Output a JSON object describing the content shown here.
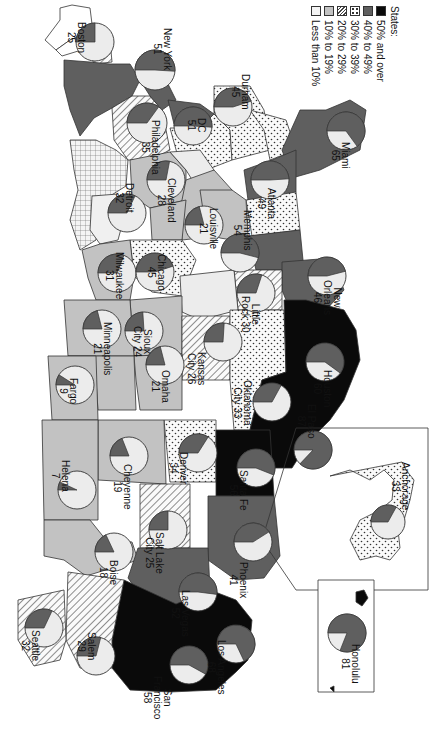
{
  "legend": {
    "title": "States:",
    "items": [
      {
        "label": "50% and over",
        "pattern": "black",
        "color": "#0a0a0a"
      },
      {
        "label": "40% to 49%",
        "pattern": "dark-gray",
        "color": "#5f5f5f"
      },
      {
        "label": "30% to 39%",
        "pattern": "dots",
        "color": "#ffffff"
      },
      {
        "label": "20% to 29%",
        "pattern": "hatch",
        "color": "#ffffff"
      },
      {
        "label": "10% to 19%",
        "pattern": "light-gray",
        "color": "#c2c2c2"
      },
      {
        "label": "Less than 10%",
        "pattern": "white",
        "color": "#ececec"
      }
    ]
  },
  "inset_labels": {
    "alaska": "Alaska inset",
    "hawaii": "Hawaii inset"
  },
  "chart_data": {
    "type": "pie",
    "title": "",
    "legend_title": "States:",
    "legend": [
      "50% and over",
      "40% to 49%",
      "30% to 39%",
      "20% to 29%",
      "10% to 19%",
      "Less than 10%"
    ],
    "cities": [
      {
        "name": "Boston",
        "value": 25
      },
      {
        "name": "New York",
        "value": 51
      },
      {
        "name": "Philadelphia",
        "value": 35
      },
      {
        "name": "D.C.",
        "value": 51
      },
      {
        "name": "Durham",
        "value": 45
      },
      {
        "name": "Miami",
        "value": 65
      },
      {
        "name": "Atlanta",
        "value": 49
      },
      {
        "name": "Detroit",
        "value": 32
      },
      {
        "name": "Cleveland",
        "value": 28
      },
      {
        "name": "Louisville",
        "value": 21
      },
      {
        "name": "Memphis",
        "value": 54
      },
      {
        "name": "Milwaukee",
        "value": 31
      },
      {
        "name": "Chicago",
        "value": 45
      },
      {
        "name": "Little Rock",
        "value": 30
      },
      {
        "name": "New Orleans",
        "value": 46
      },
      {
        "name": "Minneapolis",
        "value": 21
      },
      {
        "name": "Sioux City",
        "value": 24
      },
      {
        "name": "Kansas City",
        "value": 26
      },
      {
        "name": "Oklahoma City",
        "value": 33
      },
      {
        "name": "Houston",
        "value": 60
      },
      {
        "name": "Fargo",
        "value": 9
      },
      {
        "name": "Omaha",
        "value": 21
      },
      {
        "name": "El Paso",
        "value": 87
      },
      {
        "name": "Helena",
        "value": 7
      },
      {
        "name": "Cheyenne",
        "value": 19
      },
      {
        "name": "Denver",
        "value": 34
      },
      {
        "name": "Santa Fe",
        "value": 56
      },
      {
        "name": "Salt Lake City",
        "value": 25
      },
      {
        "name": "Phoenix",
        "value": 41
      },
      {
        "name": "Boise",
        "value": 18
      },
      {
        "name": "Las Vegas",
        "value": 52
      },
      {
        "name": "Seattle",
        "value": 32
      },
      {
        "name": "Salem",
        "value": 29
      },
      {
        "name": "Los Angeles",
        "value": 68
      },
      {
        "name": "San Francisco",
        "value": 58
      },
      {
        "name": "Anchorage",
        "value": 33
      },
      {
        "name": "Honolulu",
        "value": 81
      }
    ]
  },
  "pies": [
    {
      "name": "Boston",
      "value": 25,
      "cx": 95,
      "cy": 42,
      "r": 19,
      "label_lines": [
        "Boston",
        "25"
      ],
      "lx": 76,
      "ly": 22
    },
    {
      "name": "New York",
      "value": 51,
      "cx": 155,
      "cy": 70,
      "r": 20,
      "label_lines": [
        "New York",
        "51"
      ],
      "lx": 162,
      "ly": 28
    },
    {
      "name": "Philadelphia",
      "value": 35,
      "cx": 147,
      "cy": 123,
      "r": 20,
      "label_lines": [
        "Philadelphia",
        "35"
      ],
      "lx": 150,
      "ly": 120
    },
    {
      "name": "D.C.",
      "value": 51,
      "cx": 193,
      "cy": 126,
      "r": 19,
      "label_lines": [
        "DC",
        "51"
      ],
      "lx": 196,
      "ly": 118
    },
    {
      "name": "Durham",
      "value": 45,
      "cx": 233,
      "cy": 107,
      "r": 19,
      "label_lines": [
        "Durham",
        "45"
      ],
      "lx": 240,
      "ly": 74
    },
    {
      "name": "Miami",
      "value": 65,
      "cx": 346,
      "cy": 131,
      "r": 19,
      "label_lines": [
        "Miami",
        "65"
      ],
      "lx": 340,
      "ly": 142
    },
    {
      "name": "Atlanta",
      "value": 49,
      "cx": 270,
      "cy": 180,
      "r": 19,
      "label_lines": [
        "Atlanta",
        "49"
      ],
      "lx": 266,
      "ly": 188
    },
    {
      "name": "Detroit",
      "value": 32,
      "cx": 127,
      "cy": 213,
      "r": 19,
      "label_lines": [
        "Detroit",
        "32"
      ],
      "lx": 124,
      "ly": 183
    },
    {
      "name": "Cleveland",
      "value": 28,
      "cx": 166,
      "cy": 180,
      "r": 19,
      "label_lines": [
        "Cleveland",
        "28"
      ],
      "lx": 166,
      "ly": 178
    },
    {
      "name": "Louisville",
      "value": 21,
      "cx": 204,
      "cy": 225,
      "r": 19,
      "label_lines": [
        "Louisville",
        "21"
      ],
      "lx": 208,
      "ly": 208
    },
    {
      "name": "Memphis",
      "value": 54,
      "cx": 240,
      "cy": 253,
      "r": 19,
      "label_lines": [
        "Memphis",
        "54"
      ],
      "lx": 242,
      "ly": 210
    },
    {
      "name": "Milwaukee",
      "value": 31,
      "cx": 117,
      "cy": 273,
      "r": 19,
      "label_lines": [
        "Milwaukee",
        "31"
      ],
      "lx": 114,
      "ly": 252
    },
    {
      "name": "Chicago",
      "value": 45,
      "cx": 155,
      "cy": 272,
      "r": 19,
      "label_lines": [
        "Chicago",
        "45"
      ],
      "lx": 156,
      "ly": 254
    },
    {
      "name": "Little Rock",
      "value": 30,
      "cx": 256,
      "cy": 293,
      "r": 19,
      "label_lines": [
        "Little",
        "Rock 30"
      ],
      "lx": 250,
      "ly": 296
    },
    {
      "name": "New Orleans",
      "value": 46,
      "cx": 327,
      "cy": 276,
      "r": 19,
      "label_lines": [
        "New",
        "Orleans",
        "46"
      ],
      "lx": 332,
      "ly": 280
    },
    {
      "name": "Minneapolis",
      "value": 21,
      "cx": 102,
      "cy": 329,
      "r": 19,
      "label_lines": [
        "Minneapolis",
        "21"
      ],
      "lx": 102,
      "ly": 322
    },
    {
      "name": "Sioux City",
      "value": 24,
      "cx": 144,
      "cy": 331,
      "r": 19,
      "label_lines": [
        "Sioux",
        "City 24"
      ],
      "lx": 142,
      "ly": 326
    },
    {
      "name": "Kansas City",
      "value": 26,
      "cx": 223,
      "cy": 342,
      "r": 19,
      "label_lines": [
        "Kansas",
        "City 26"
      ],
      "lx": 196,
      "ly": 352
    },
    {
      "name": "Oklahoma City",
      "value": 33,
      "cx": 272,
      "cy": 402,
      "r": 19,
      "label_lines": [
        "Oklahoma",
        "City 33"
      ],
      "lx": 242,
      "ly": 380
    },
    {
      "name": "Houston",
      "value": 60,
      "cx": 325,
      "cy": 362,
      "r": 19,
      "label_lines": [
        "Houston",
        "60"
      ],
      "lx": 322,
      "ly": 370
    },
    {
      "name": "Fargo",
      "value": 9,
      "cx": 75,
      "cy": 385,
      "r": 19,
      "label_lines": [
        "Fargo",
        "9"
      ],
      "lx": 68,
      "ly": 378
    },
    {
      "name": "Omaha",
      "value": 21,
      "cx": 165,
      "cy": 365,
      "r": 19,
      "label_lines": [
        "Omaha",
        "21"
      ],
      "lx": 160,
      "ly": 370
    },
    {
      "name": "El Paso",
      "value": 87,
      "cx": 313,
      "cy": 450,
      "r": 19,
      "label_lines": [
        "El Paso",
        "87"
      ],
      "lx": 306,
      "ly": 404
    },
    {
      "name": "Helena",
      "value": 7,
      "cx": 77,
      "cy": 490,
      "r": 19,
      "label_lines": [
        "Helena",
        "7"
      ],
      "lx": 60,
      "ly": 460
    },
    {
      "name": "Cheyenne",
      "value": 19,
      "cx": 129,
      "cy": 456,
      "r": 19,
      "label_lines": [
        "Cheyenne",
        "19"
      ],
      "lx": 122,
      "ly": 464
    },
    {
      "name": "Denver",
      "value": 34,
      "cx": 198,
      "cy": 453,
      "r": 19,
      "label_lines": [
        "Denver",
        "34"
      ],
      "lx": 178,
      "ly": 452
    },
    {
      "name": "Santa Fe",
      "value": 56,
      "cx": 256,
      "cy": 468,
      "r": 19,
      "label_lines": [
        "Santa Fe",
        "56"
      ],
      "lx": 238,
      "ly": 470
    },
    {
      "name": "Salt Lake City",
      "value": 25,
      "cx": 168,
      "cy": 530,
      "r": 19,
      "label_lines": [
        "Salt Lake",
        "City 25"
      ],
      "lx": 154,
      "ly": 532
    },
    {
      "name": "Phoenix",
      "value": 41,
      "cx": 253,
      "cy": 542,
      "r": 19,
      "label_lines": [
        "Phoenix",
        "41"
      ],
      "lx": 238,
      "ly": 562
    },
    {
      "name": "Boise",
      "value": 18,
      "cx": 114,
      "cy": 552,
      "r": 19,
      "label_lines": [
        "Boise",
        "18"
      ],
      "lx": 108,
      "ly": 560
    },
    {
      "name": "Las Vegas",
      "value": 52,
      "cx": 198,
      "cy": 592,
      "r": 19,
      "label_lines": [
        "Las Vegas",
        "52"
      ],
      "lx": 180,
      "ly": 590
    },
    {
      "name": "Seattle",
      "value": 32,
      "cx": 44,
      "cy": 628,
      "r": 19,
      "label_lines": [
        "Seattle",
        "32"
      ],
      "lx": 30,
      "ly": 630
    },
    {
      "name": "Salem",
      "value": 29,
      "cx": 96,
      "cy": 656,
      "r": 19,
      "label_lines": [
        "Salem",
        "29"
      ],
      "lx": 86,
      "ly": 632
    },
    {
      "name": "Los Angeles",
      "value": 68,
      "cx": 236,
      "cy": 644,
      "r": 19,
      "label_lines": [
        "Los Angeles",
        "68"
      ],
      "lx": 216,
      "ly": 640
    },
    {
      "name": "San Francisco",
      "value": 58,
      "cx": 189,
      "cy": 665,
      "r": 19,
      "label_lines": [
        "San",
        "Francisco",
        "58"
      ],
      "lx": 162,
      "ly": 676
    },
    {
      "name": "Anchorage",
      "value": 33,
      "cx": 388,
      "cy": 522,
      "r": 17,
      "label_lines": [
        "Anchorage",
        "33"
      ],
      "lx": 400,
      "ly": 462
    },
    {
      "name": "Honolulu",
      "value": 81,
      "cx": 347,
      "cy": 633,
      "r": 19,
      "label_lines": [
        "Honolulu",
        "81"
      ],
      "lx": 350,
      "ly": 644
    }
  ]
}
